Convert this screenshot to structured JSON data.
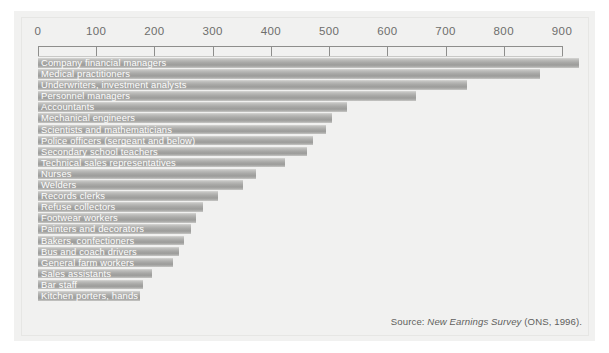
{
  "chart_data": {
    "type": "bar",
    "orientation": "horizontal",
    "title": "",
    "subtitle": "",
    "xlabel": "",
    "ylabel": "",
    "xlim": [
      0,
      940
    ],
    "grid": false,
    "legend": null,
    "axis_ticks": [
      0,
      100,
      200,
      300,
      400,
      500,
      600,
      700,
      800,
      900
    ],
    "categories": [
      "Company financial managers",
      "Medical practitioners",
      "Underwriters, investment analysts",
      "Personnel managers",
      "Accountants",
      "Mechanical engineers",
      "Scientists and mathematicians",
      "Police officers (sergeant and below)",
      "Secondary school teachers",
      "Technical sales representatives",
      "Nurses",
      "Welders",
      "Records clerks",
      "Refuse collectors",
      "Footwear workers",
      "Painters and decorators",
      "Bakers, confectioners",
      "Bus and coach drivers",
      "General farm workers",
      "Sales assistants",
      "Bar staff",
      "Kitchen porters, hands"
    ],
    "values": [
      930,
      862,
      737,
      650,
      530,
      505,
      495,
      472,
      462,
      425,
      375,
      352,
      310,
      283,
      272,
      263,
      250,
      243,
      232,
      196,
      180,
      175
    ],
    "source": {
      "label": "Source: ",
      "title": "New Earnings Survey",
      "suffix": " (ONS, 1996)."
    },
    "colors": {
      "panel_background": "#f1f1f0",
      "bar_light": "#d6d6d4",
      "bar_mid": "#a8a8a6",
      "bar_dark": "#9c9c9a",
      "axis": "#8e8e8c",
      "tick_label": "#6e6e6c",
      "bar_label": "#ffffff",
      "source_text": "#5f5f5d"
    }
  }
}
